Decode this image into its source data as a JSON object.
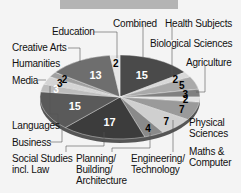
{
  "title": "",
  "chart_data": {
    "type": "pie",
    "title": "",
    "legend_position": "callouts",
    "center": [
      120,
      97
    ],
    "radii": [
      80,
      42
    ],
    "slices": [
      {
        "label": "Combined",
        "value": 15,
        "color": "#4a4a4a",
        "text_color": "#ffffff"
      },
      {
        "label": "Health Subjects",
        "value": 2,
        "color": "#d8d8d8",
        "text_color": "#000000"
      },
      {
        "label": "Biological Sciences",
        "value": 5,
        "color": "#a9a9a9",
        "text_color": "#000000"
      },
      {
        "label": "Agriculture",
        "value": 3,
        "color": "#808080",
        "text_color": "#000000"
      },
      {
        "label": "Physical Sciences",
        "value": 2,
        "color": "#e2e2e2",
        "text_color": "#000000"
      },
      {
        "label": "Maths & Computer",
        "value": 7,
        "color": "#9a9a9a",
        "text_color": "#000000"
      },
      {
        "label": "Engineering/ Technology",
        "value": 7,
        "color": "#cfcfcf",
        "text_color": "#000000"
      },
      {
        "label": "Planning/ Building/ Architecture",
        "value": 4,
        "color": "#8a8a8a",
        "text_color": "#000000"
      },
      {
        "label": "Social Studies incl. Law",
        "value": 17,
        "color": "#3c3c3c",
        "text_color": "#ffffff"
      },
      {
        "label": "Business",
        "value": 15,
        "color": "#5a5a5a",
        "text_color": "#ffffff"
      },
      {
        "label": "Languages",
        "value": 3,
        "color": "#bdbdbd",
        "text_color": "#ffffff"
      },
      {
        "label": "Media",
        "value": 3,
        "color": "#d4d4d4",
        "text_color": "#000000"
      },
      {
        "label": "Humanities",
        "value": 2,
        "color": "#a0a0a0",
        "text_color": "#000000"
      },
      {
        "label": "Creative Arts",
        "value": 13,
        "color": "#6e6e6e",
        "text_color": "#ffffff"
      },
      {
        "label": "Education",
        "value": 2,
        "color": "#e6e6e6",
        "text_color": "#000000"
      }
    ]
  },
  "labels": {
    "combined": "Combined",
    "health": "Health Subjects",
    "bio": "Biological Sciences",
    "agri": "Agriculture",
    "phys1": "Physical",
    "phys2": "Sciences",
    "maths1": "Maths &",
    "maths2": "Computer",
    "eng1": "Engineering/",
    "eng2": "Technology",
    "plan1": "Planning/",
    "plan2": "Building/",
    "plan3": "Architecture",
    "soc1": "Social Studies",
    "soc2": "incl. Law",
    "business": "Business",
    "languages": "Languages",
    "media": "Media",
    "humanities": "Humanities",
    "creative": "Creative Arts",
    "education": "Education"
  }
}
